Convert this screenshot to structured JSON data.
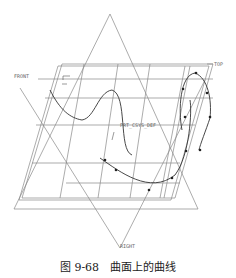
{
  "diagram": {
    "labels": {
      "front": "FRONT",
      "top": "TOP",
      "right": "RIGHT",
      "csys": "PRT_CSYS_DEF"
    }
  },
  "caption": "图 9-68　曲面上的曲线"
}
